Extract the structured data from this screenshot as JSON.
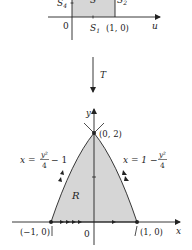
{
  "top_figure": {
    "labels": {
      "s4": "S",
      "s4_sub": "4",
      "s": "S",
      "s2": "S",
      "s2_sub": "2",
      "origin": "0",
      "s1": "S",
      "s1_sub": "1",
      "point_1_0": "(1, 0)",
      "axis_u": "u"
    }
  },
  "transform": {
    "label": "T"
  },
  "bottom_figure": {
    "labels": {
      "axis_y": "y",
      "axis_x": "x",
      "point_0_2": "(0, 2)",
      "point_neg1_0": "(−1, 0)",
      "point_1_0": "(1, 0)",
      "origin": "0",
      "region": "R",
      "left_curve_x": "x =",
      "left_curve_num": "y²",
      "left_curve_den": "4",
      "left_curve_tail": "− 1",
      "right_curve_x": "x = 1 −",
      "right_curve_num": "y²",
      "right_curve_den": "4"
    }
  },
  "colors": {
    "fill": "#d6d6d6",
    "stroke": "#222222"
  }
}
